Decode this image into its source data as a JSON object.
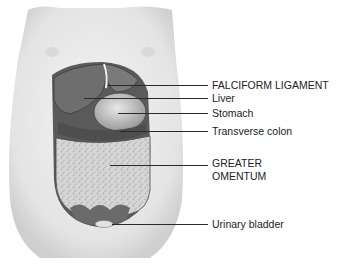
{
  "figure": {
    "labels": [
      {
        "id": "falciform",
        "text": "FALCIFORM LIGAMENT",
        "x": 212,
        "y": 80,
        "line_from": 108,
        "line_y": 85
      },
      {
        "id": "liver",
        "text": "Liver",
        "x": 212,
        "y": 94,
        "line_from": 84,
        "line_y": 98
      },
      {
        "id": "stomach",
        "text": "Stomach",
        "x": 212,
        "y": 109,
        "line_from": 118,
        "line_y": 113
      },
      {
        "id": "transverse-colon",
        "text": "Transverse colon",
        "x": 212,
        "y": 126,
        "line_from": 120,
        "line_y": 131
      },
      {
        "id": "greater-omentum-1",
        "text": "GREATER",
        "x": 212,
        "y": 158,
        "line_from": 110,
        "line_y": 165
      },
      {
        "id": "greater-omentum-2",
        "text": "OMENTUM",
        "x": 212,
        "y": 171,
        "line_from": null,
        "line_y": null
      },
      {
        "id": "urinary-bladder",
        "text": "Urinary bladder",
        "x": 212,
        "y": 218,
        "line_from": 112,
        "line_y": 224
      }
    ]
  }
}
